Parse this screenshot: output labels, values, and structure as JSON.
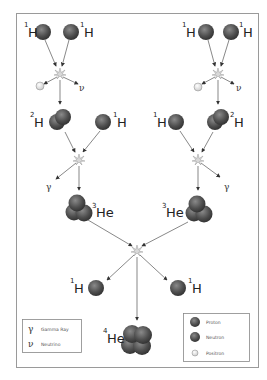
{
  "diagram": {
    "colors": {
      "frame": "#9a9a9a",
      "arrow": "#555555",
      "particle": "#555555",
      "positron": "#f2f2f2",
      "star": "#bbbbbb"
    },
    "left_branch": {
      "input1": {
        "mass": "1",
        "symbol": "H"
      },
      "input2": {
        "mass": "1",
        "symbol": "H"
      },
      "product": {
        "mass": "2",
        "symbol": "H"
      },
      "emitted_neutrino": "ν",
      "second_input": {
        "mass": "1",
        "symbol": "H"
      },
      "gamma": "γ",
      "result": {
        "mass": "3",
        "symbol": "He"
      }
    },
    "right_branch": {
      "input1": {
        "mass": "1",
        "symbol": "H"
      },
      "input2": {
        "mass": "1",
        "symbol": "H"
      },
      "product": {
        "mass": "2",
        "symbol": "H"
      },
      "emitted_neutrino": "ν",
      "second_input": {
        "mass": "1",
        "symbol": "H"
      },
      "gamma": "γ",
      "result": {
        "mass": "3",
        "symbol": "He"
      }
    },
    "final": {
      "released_left": {
        "mass": "1",
        "symbol": "H"
      },
      "released_right": {
        "mass": "1",
        "symbol": "H"
      },
      "product": {
        "mass": "4",
        "symbol": "He"
      }
    }
  },
  "legend_symbols": {
    "items": [
      {
        "symbol": "γ",
        "label": "Gamma Ray"
      },
      {
        "symbol": "ν",
        "label": "Neutrino"
      }
    ]
  },
  "legend_particles": {
    "items": [
      {
        "icon": "proton-icon",
        "label": "Proton"
      },
      {
        "icon": "neutron-icon",
        "label": "Neutron"
      },
      {
        "icon": "positron-icon",
        "label": "Positron"
      }
    ]
  }
}
